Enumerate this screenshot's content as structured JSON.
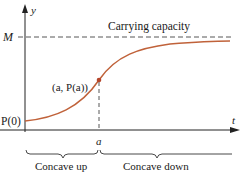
{
  "diagram": {
    "axes": {
      "y_label": "y",
      "x_label": "t"
    },
    "labels": {
      "M": "M",
      "carrying_capacity": "Carrying capacity",
      "point": "(a, P(a))",
      "P0": "P(0)",
      "a": "a",
      "concave_up": "Concave up",
      "concave_down": "Concave down"
    },
    "colors": {
      "curve": "#c0623a",
      "point": "#b5452a",
      "axis": "#222222",
      "dashed": "#444444"
    }
  }
}
